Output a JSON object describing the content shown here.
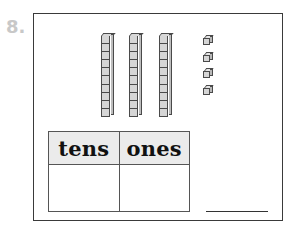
{
  "problem": {
    "number_label": "8."
  },
  "model": {
    "tens_rods": 3,
    "units_per_rod": 10,
    "ones_cubes": 4,
    "icons": {
      "rod": "base-ten-rod-icon",
      "cube": "unit-cube-icon"
    }
  },
  "place_value_table": {
    "headers": [
      "tens",
      "ones"
    ],
    "values": [
      "",
      ""
    ]
  },
  "answer": {
    "value": ""
  },
  "colors": {
    "frame_border": "#3a3a3a",
    "block_fill": "#d6d6d6",
    "header_fill": "#ebebeb",
    "number_label": "#c8c8c8"
  }
}
